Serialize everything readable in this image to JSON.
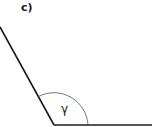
{
  "diagram": {
    "part_label": "c)",
    "angle_label": "γ",
    "stroke_color": "#1a1a1a",
    "arc_color": "#555555"
  }
}
